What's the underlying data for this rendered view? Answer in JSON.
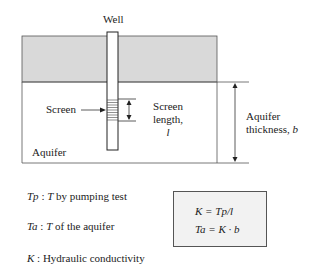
{
  "diagram": {
    "labels": {
      "well": "Well",
      "screen": "Screen",
      "screen_length_line1": "Screen",
      "screen_length_line2": "length,",
      "screen_length_symbol": "l",
      "aquifer_thickness_line1": "Aquifer",
      "aquifer_thickness_line2": "thickness,",
      "aquifer_thickness_symbol": "b",
      "aquifer": "Aquifer"
    },
    "colors": {
      "confining_layer": "#d9d9d9",
      "lines": "#333333",
      "formula_box_bg": "#f2f2f2"
    }
  },
  "legend": [
    {
      "symbol": "Tp",
      "separator": " : ",
      "symbol2": "T",
      "text": " by pumping test"
    },
    {
      "symbol": "Ta",
      "separator": " : ",
      "symbol2": "T",
      "text": " of the aquifer"
    },
    {
      "symbol": "K",
      "separator": " : ",
      "symbol2": "",
      "text": "Hydraulic conductivity"
    }
  ],
  "formulas": {
    "line1": "K = Tp/l",
    "line2": "Ta = K · b"
  }
}
